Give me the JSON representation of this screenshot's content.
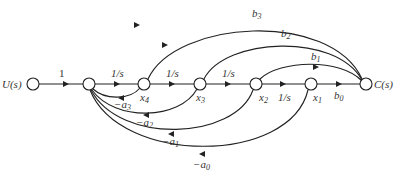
{
  "diagram": {
    "type": "signal-flow-graph",
    "nodes": [
      {
        "id": "U",
        "label": "U(s)",
        "x": 33,
        "y": 84
      },
      {
        "id": "n1",
        "label": "",
        "x": 89,
        "y": 84
      },
      {
        "id": "x4",
        "label": "x",
        "sub": "4",
        "x": 144,
        "y": 84
      },
      {
        "id": "x3",
        "label": "x",
        "sub": "3",
        "x": 200,
        "y": 84
      },
      {
        "id": "x2",
        "label": "x",
        "sub": "2",
        "x": 256,
        "y": 84
      },
      {
        "id": "x1",
        "label": "x",
        "sub": "1",
        "x": 311,
        "y": 84
      },
      {
        "id": "C",
        "label": "C(s)",
        "x": 366,
        "y": 84
      }
    ],
    "forward_edges": [
      {
        "from": "U",
        "to": "n1",
        "gain": "1"
      },
      {
        "from": "n1",
        "to": "x4",
        "gain": "1/s"
      },
      {
        "from": "x4",
        "to": "x3",
        "gain": "1/s"
      },
      {
        "from": "x3",
        "to": "x2",
        "gain": "1/s"
      },
      {
        "from": "x2",
        "to": "x1",
        "gain": "1/s"
      },
      {
        "from": "x1",
        "to": "C",
        "gain": "b",
        "gain_sub": "0"
      }
    ],
    "feedforward_edges": [
      {
        "from": "x4",
        "to": "C",
        "gain": "b",
        "gain_sub": "3"
      },
      {
        "from": "x3",
        "to": "C",
        "gain": "b",
        "gain_sub": "2"
      },
      {
        "from": "x2",
        "to": "C",
        "gain": "b",
        "gain_sub": "1"
      }
    ],
    "feedback_edges": [
      {
        "from": "x4",
        "to": "n1",
        "gain": "−a",
        "gain_sub": "3"
      },
      {
        "from": "x3",
        "to": "n1",
        "gain": "−a",
        "gain_sub": "2"
      },
      {
        "from": "x2",
        "to": "n1",
        "gain": "−a",
        "gain_sub": "1"
      },
      {
        "from": "x1",
        "to": "n1",
        "gain": "−a",
        "gain_sub": "0"
      }
    ]
  },
  "labels": {
    "input": "U(s)",
    "output": "C(s)",
    "g_in": "1",
    "g_1s": "1/s",
    "x": "x",
    "b": "b",
    "neg_a": "−a",
    "s4": "4",
    "s3": "3",
    "s2": "2",
    "s1": "1",
    "s0": "0"
  }
}
